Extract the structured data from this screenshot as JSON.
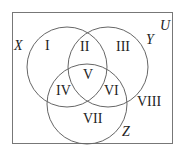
{
  "diagram": {
    "type": "venn",
    "universe_label": "U",
    "sets": [
      {
        "name": "X",
        "cx": 67,
        "cy": 67,
        "r": 40,
        "label_x": 16,
        "label_y": 50
      },
      {
        "name": "Y",
        "cx": 108,
        "cy": 67,
        "r": 40,
        "label_x": 150,
        "label_y": 43
      },
      {
        "name": "Z",
        "cx": 87,
        "cy": 104,
        "r": 40,
        "label_x": 124,
        "label_y": 136
      }
    ],
    "regions": [
      {
        "label": "I",
        "x": 50,
        "y": 50
      },
      {
        "label": "II",
        "x": 88,
        "y": 51
      },
      {
        "label": "III",
        "x": 125,
        "y": 51
      },
      {
        "label": "V",
        "x": 88,
        "y": 78
      },
      {
        "label": "IV",
        "x": 68,
        "y": 95
      },
      {
        "label": "VI",
        "x": 112,
        "y": 95
      },
      {
        "label": "VII",
        "x": 92,
        "y": 124
      },
      {
        "label": "VIII",
        "x": 150,
        "y": 108
      }
    ]
  }
}
